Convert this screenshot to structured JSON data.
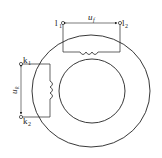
{
  "diagram": {
    "colors": {
      "stroke": "#222222",
      "background": "#ffffff"
    },
    "primary_winding": {
      "terminals": [
        {
          "label": "l",
          "sub": "1"
        },
        {
          "label": "l",
          "sub": "2"
        }
      ],
      "voltage": {
        "label": "u",
        "sub": "f"
      }
    },
    "secondary_winding": {
      "terminals": [
        {
          "label": "k",
          "sub": "1"
        },
        {
          "label": "k",
          "sub": "2"
        }
      ],
      "voltage": {
        "label": "u",
        "sub": "k"
      }
    }
  }
}
